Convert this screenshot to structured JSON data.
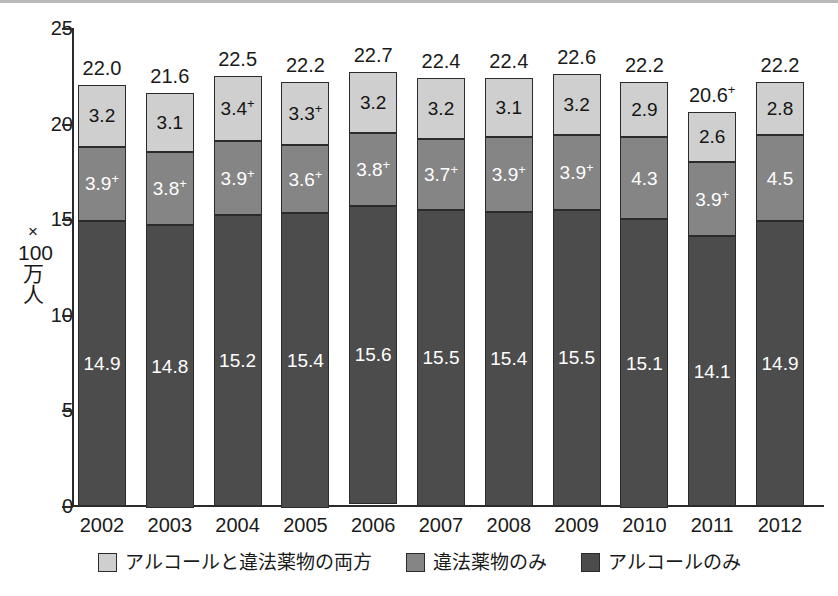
{
  "chart_data": {
    "type": "bar",
    "subtype": "stacked-bar",
    "title": "",
    "xlabel": "",
    "ylabel": "×100万人",
    "ylabel_lines": [
      "×",
      "100",
      "万",
      "人"
    ],
    "ylim": [
      0,
      25
    ],
    "yticks": [
      0,
      5,
      10,
      15,
      20,
      25
    ],
    "ytick_labels": [
      "0",
      "5",
      "10",
      "15",
      "20",
      "25"
    ],
    "grid": false,
    "legend_position": "bottom",
    "categories": [
      "2002",
      "2003",
      "2004",
      "2005",
      "2006",
      "2007",
      "2008",
      "2009",
      "2010",
      "2011",
      "2012"
    ],
    "series": [
      {
        "name": "アルコールと違法薬物の両方",
        "color": "#cfcfcf",
        "values": [
          3.2,
          3.1,
          3.4,
          3.3,
          3.2,
          3.2,
          3.1,
          3.2,
          2.9,
          2.6,
          2.8
        ],
        "labels": [
          "3.2",
          "3.1",
          "3.4",
          "3.3",
          "3.2",
          "3.2",
          "3.1",
          "3.2",
          "2.9",
          "2.6",
          "2.8"
        ],
        "marks": [
          "",
          "",
          "+",
          "+",
          "",
          "",
          "",
          "",
          "",
          "",
          ""
        ]
      },
      {
        "name": "違法薬物のみ",
        "color": "#858585",
        "values": [
          3.9,
          3.8,
          3.9,
          3.6,
          3.8,
          3.7,
          3.9,
          3.9,
          4.3,
          3.9,
          4.5
        ],
        "labels": [
          "3.9",
          "3.8",
          "3.9",
          "3.6",
          "3.8",
          "3.7",
          "3.9",
          "3.9",
          "4.3",
          "3.9",
          "4.5"
        ],
        "marks": [
          "+",
          "+",
          "+",
          "+",
          "+",
          "+",
          "+",
          "+",
          "",
          "+",
          ""
        ]
      },
      {
        "name": "アルコールのみ",
        "color": "#4c4c4c",
        "values": [
          14.9,
          14.8,
          15.2,
          15.4,
          15.6,
          15.5,
          15.4,
          15.5,
          15.1,
          14.1,
          14.9
        ],
        "labels": [
          "14.9",
          "14.8",
          "15.2",
          "15.4",
          "15.6",
          "15.5",
          "15.4",
          "15.5",
          "15.1",
          "14.1",
          "14.9"
        ],
        "marks": [
          "",
          "",
          "",
          "",
          "",
          "",
          "",
          "",
          "",
          "",
          ""
        ]
      }
    ],
    "totals": [
      22.0,
      21.6,
      22.5,
      22.2,
      22.7,
      22.4,
      22.4,
      22.6,
      22.2,
      20.6,
      22.2
    ],
    "total_labels": [
      "22.0",
      "21.6",
      "22.5",
      "22.2",
      "22.7",
      "22.4",
      "22.4",
      "22.6",
      "22.2",
      "20.6",
      "22.2"
    ],
    "total_marks": [
      "",
      "",
      "",
      "",
      "",
      "",
      "",
      "",
      "",
      "+",
      ""
    ]
  },
  "legend": {
    "items": [
      {
        "label": "アルコールと違法薬物の両方",
        "color": "#cfcfcf",
        "swatch_name": "legend-swatch-both"
      },
      {
        "label": "違法薬物のみ",
        "color": "#858585",
        "swatch_name": "legend-swatch-drugs-only"
      },
      {
        "label": "アルコールのみ",
        "color": "#4c4c4c",
        "swatch_name": "legend-swatch-alcohol-only"
      }
    ]
  }
}
